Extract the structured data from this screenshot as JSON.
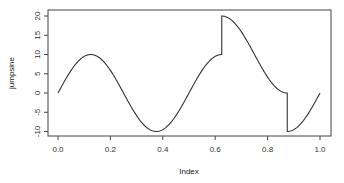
{
  "chart_data": {
    "type": "line",
    "title": "",
    "xlabel": "Index",
    "ylabel": "jumpsine",
    "xlim": [
      0.0,
      1.0
    ],
    "ylim": [
      -10,
      20
    ],
    "grid": false,
    "legend": null,
    "x_ticks": [
      0.0,
      0.2,
      0.4,
      0.6,
      0.8,
      1.0
    ],
    "x_tick_labels": [
      "0.0",
      "0.2",
      "0.4",
      "0.6",
      "0.8",
      "1.0"
    ],
    "y_ticks": [
      -10,
      -5,
      0,
      5,
      10,
      15,
      20
    ],
    "y_tick_labels": [
      "-10",
      "-5",
      "0",
      "5",
      "10",
      "15",
      "20"
    ],
    "series": [
      {
        "name": "jumpsine",
        "description": "10*sin(4*pi*t), plus 10 on the interval 0.625 <= t < 0.875",
        "color": "#333333",
        "x": [
          0.0,
          0.0625,
          0.125,
          0.1875,
          0.25,
          0.3125,
          0.375,
          0.4375,
          0.5,
          0.5625,
          0.625,
          0.625,
          0.6875,
          0.75,
          0.8125,
          0.875,
          0.875,
          0.9375,
          1.0
        ],
        "y": [
          0.0,
          7.07,
          10.0,
          7.07,
          0.0,
          -7.07,
          -10.0,
          -7.07,
          0.0,
          7.07,
          10.0,
          20.0,
          17.07,
          10.0,
          2.93,
          0.0,
          -10.0,
          -7.07,
          0.0
        ]
      }
    ],
    "jumps": [
      {
        "x": 0.625,
        "from": 10,
        "to": 20
      },
      {
        "x": 0.875,
        "from": 0,
        "to": -10
      }
    ]
  }
}
